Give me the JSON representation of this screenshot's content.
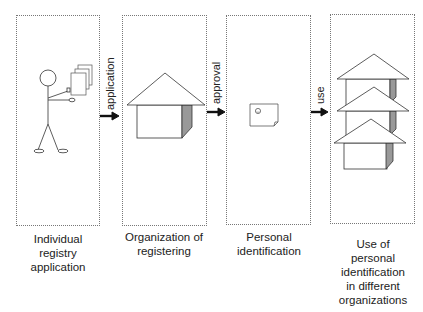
{
  "diagram": {
    "type": "process-flow",
    "stages": [
      {
        "id": "individual",
        "caption_lines": [
          "Individual",
          "registry",
          "application"
        ],
        "illustration": "stick-figure-holding-documents"
      },
      {
        "id": "organization",
        "caption_lines": [
          "Organization of",
          "registering"
        ],
        "illustration": "house"
      },
      {
        "id": "personal-id",
        "caption_lines": [
          "Personal",
          "identification"
        ],
        "illustration": "id-card"
      },
      {
        "id": "use",
        "caption_lines": [
          "Use of",
          "personal",
          "identification",
          "in different",
          "organizations"
        ],
        "illustration": "stacked-houses"
      }
    ],
    "arrows": [
      {
        "from": "individual",
        "to": "organization",
        "label": "application"
      },
      {
        "from": "organization",
        "to": "personal-id",
        "label": "approval"
      },
      {
        "from": "personal-id",
        "to": "use",
        "label": "use"
      }
    ],
    "colors": {
      "line": "#333333",
      "dotted_border": "#777777",
      "house_side": "#999999",
      "background": "#ffffff"
    }
  }
}
